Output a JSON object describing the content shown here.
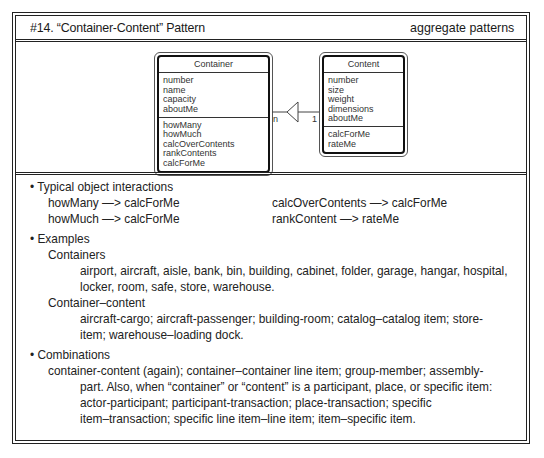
{
  "header": {
    "title": "#14. “Container-Content” Pattern",
    "category": "aggregate  patterns"
  },
  "diagram": {
    "container": {
      "name": "Container",
      "attributes": [
        "number",
        "name",
        "capacity",
        "aboutMe"
      ],
      "services": [
        "howMany",
        "howMuch",
        "calcOverContents",
        "rankContents",
        "calcForMe"
      ]
    },
    "content": {
      "name": "Content",
      "attributes": [
        "number",
        "size",
        "weight",
        "dimensions",
        "aboutMe"
      ],
      "services": [
        "calcForMe",
        "rateMe"
      ]
    },
    "association": {
      "container_multiplicity": "n",
      "content_multiplicity": "1",
      "type": "whole-part"
    }
  },
  "sections": {
    "interactions": {
      "bullet": "• Typical object interactions",
      "items": [
        "howMany —> calcForMe",
        "howMuch —> calcForMe",
        "calcOverContents —> calcForMe",
        "rankContent —> rateMe"
      ]
    },
    "examples": {
      "bullet": "• Examples",
      "containers_label": "Containers",
      "containers_lines": [
        "airport, aircraft, aisle, bank, bin, building, cabinet, folder, garage, hangar, hospital,",
        "locker, room, safe, store, warehouse."
      ],
      "container_content_label": "Container–content",
      "container_content_lines": [
        "aircraft-cargo; aircraft-passenger; building-room; catalog–catalog item; store-",
        "item; warehouse–loading dock."
      ]
    },
    "combinations": {
      "bullet": "• Combinations",
      "lines": [
        "container-content (again); container–container line item; group-member; assembly-",
        "part. Also, when “container” or “content” is a participant, place, or specific item:",
        "actor-participant; participant-transaction; place-transaction; specific",
        "item–transaction; specific line item–line item; item–specific item."
      ]
    }
  }
}
